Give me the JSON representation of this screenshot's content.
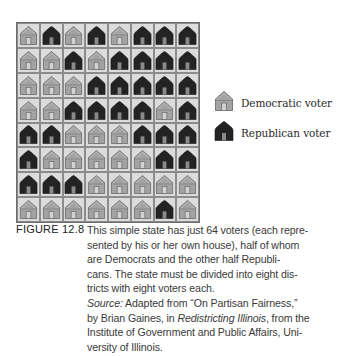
{
  "figure": {
    "label": "FIGURE 12.8",
    "caption_lines": [
      "This simple state has just 64 voters (each repre-",
      "sented by his or her own house), half of whom",
      "are Democrats and the other half Republi-",
      "cans. The state must be divided into eight dis-",
      "tricts with eight voters each."
    ],
    "source": {
      "label": "Source:",
      "line1_rest": " Adapted from “On Partisan Fairness,”",
      "line2_pre": "by Brian Gaines, in ",
      "line2_title": "Redistricting Illinois",
      "line2_post": ", from the",
      "line3": "Institute of Government and Public Affairs, Uni-",
      "line4": "versity of Illinois."
    }
  },
  "legend": {
    "democratic": {
      "label": "Democratic voter",
      "icon": "light-house-icon",
      "color": "#a3a3a3"
    },
    "republican": {
      "label": "Republican voter",
      "icon": "dark-house-icon",
      "color": "#232323"
    }
  },
  "grid": {
    "rows": 8,
    "cols": 8,
    "total_voters": 64,
    "cells": [
      [
        "D",
        "R",
        "D",
        "R",
        "D",
        "R",
        "R",
        "R"
      ],
      [
        "D",
        "D",
        "R",
        "D",
        "R",
        "R",
        "R",
        "R"
      ],
      [
        "D",
        "D",
        "D",
        "R",
        "R",
        "R",
        "R",
        "R"
      ],
      [
        "D",
        "D",
        "R",
        "R",
        "R",
        "R",
        "D",
        "R"
      ],
      [
        "R",
        "R",
        "D",
        "D",
        "D",
        "R",
        "R",
        "R"
      ],
      [
        "R",
        "D",
        "D",
        "D",
        "D",
        "D",
        "R",
        "R"
      ],
      [
        "R",
        "R",
        "R",
        "D",
        "D",
        "D",
        "D",
        "D"
      ],
      [
        "D",
        "D",
        "D",
        "D",
        "D",
        "D",
        "R",
        "D"
      ]
    ]
  }
}
